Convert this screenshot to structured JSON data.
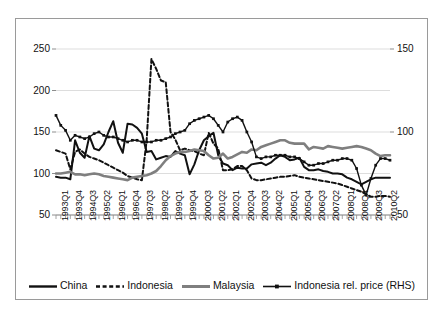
{
  "chart_data": {
    "type": "line",
    "title": "",
    "xlabel": "",
    "ylabel": "",
    "ylim": [
      50,
      250
    ],
    "y2lim": [
      50,
      150
    ],
    "grid": true,
    "legend_position": "bottom",
    "yticks": [
      50,
      100,
      150,
      200,
      250
    ],
    "y2ticks": [
      50,
      100,
      150
    ],
    "x": [
      "1993Q1",
      "1993Q2",
      "1993Q3",
      "1993Q4",
      "1994Q1",
      "1994Q2",
      "1994Q3",
      "1994Q4",
      "1995Q1",
      "1995Q2",
      "1995Q3",
      "1995Q4",
      "1996Q1",
      "1996Q2",
      "1996Q3",
      "1996Q4",
      "1997Q1",
      "1997Q2",
      "1997Q3",
      "1997Q4",
      "1998Q1",
      "1998Q2",
      "1998Q3",
      "1998Q4",
      "1999Q1",
      "1999Q2",
      "1999Q3",
      "1999Q4",
      "2000Q1",
      "2000Q2",
      "2000Q3",
      "2000Q4",
      "2001Q1",
      "2001Q2",
      "2001Q3",
      "2001Q4",
      "2002Q1",
      "2002Q2",
      "2002Q3",
      "2002Q4",
      "2003Q1",
      "2003Q2",
      "2003Q3",
      "2003Q4",
      "2004Q1",
      "2004Q2",
      "2004Q3",
      "2004Q4",
      "2005Q1",
      "2005Q2",
      "2005Q3",
      "2005Q4",
      "2006Q1",
      "2006Q2",
      "2006Q3",
      "2006Q4",
      "2007Q1",
      "2007Q2",
      "2007Q3",
      "2007Q4",
      "2008Q1",
      "2008Q2",
      "2008Q3",
      "2008Q4",
      "2009Q1",
      "2009Q2",
      "2009Q3",
      "2009Q4",
      "2010Q1",
      "2010Q2",
      "2010Q3"
    ],
    "xtick_labels": [
      "1993Q1",
      "1993Q4",
      "1994Q3",
      "1995Q2",
      "1996Q1",
      "1996Q4",
      "1997Q3",
      "1998Q2",
      "1999Q1",
      "1999Q4",
      "2000Q3",
      "2001Q2",
      "2002Q1",
      "2002Q4",
      "2003Q3",
      "2004Q2",
      "2005Q1",
      "2005Q4",
      "2006Q3",
      "2007Q2",
      "2008Q1",
      "2008Q4",
      "2009Q3",
      "2010Q2"
    ],
    "xtick_every": 3,
    "series": [
      {
        "name": "China",
        "axis": "left",
        "style": "solid",
        "color": "#111111",
        "width": 2.0,
        "markers": false,
        "values": [
          96,
          95,
          95,
          93,
          140,
          125,
          119,
          145,
          130,
          128,
          135,
          150,
          163,
          137,
          125,
          160,
          159,
          155,
          148,
          126,
          127,
          117,
          119,
          121,
          120,
          127,
          124,
          122,
          99,
          111,
          128,
          140,
          145,
          149,
          122,
          112,
          110,
          104,
          107,
          106,
          106,
          111,
          112,
          113,
          110,
          113,
          118,
          122,
          120,
          116,
          117,
          119,
          108,
          104,
          104,
          105,
          103,
          102,
          100,
          100,
          99,
          95,
          93,
          90,
          87,
          90,
          93,
          95,
          95,
          95,
          95
        ]
      },
      {
        "name": "Indonesia",
        "axis": "left",
        "style": "dashed",
        "color": "#111111",
        "width": 2.0,
        "markers": false,
        "values": [
          128,
          126,
          124,
          105,
          126,
          129,
          124,
          120,
          118,
          116,
          113,
          110,
          107,
          104,
          101,
          97,
          95,
          93,
          92,
          140,
          238,
          226,
          212,
          210,
          150,
          141,
          128,
          130,
          128,
          127,
          124,
          122,
          149,
          136,
          130,
          104,
          104,
          105,
          109,
          109,
          104,
          94,
          92,
          92,
          93,
          94,
          95,
          96,
          96,
          97,
          98,
          96,
          95,
          94,
          93,
          92,
          91,
          90,
          89,
          88,
          86,
          84,
          82,
          80,
          78,
          75,
          72,
          72,
          73,
          73,
          72
        ]
      },
      {
        "name": "Malaysia",
        "axis": "left",
        "style": "solid",
        "color": "#7f7f7f",
        "width": 2.6,
        "markers": false,
        "values": [
          100,
          100,
          101,
          102,
          99,
          99,
          98,
          99,
          100,
          99,
          97,
          96,
          95,
          94,
          93,
          92,
          95,
          96,
          97,
          98,
          100,
          103,
          109,
          116,
          121,
          124,
          126,
          126,
          127,
          129,
          128,
          127,
          122,
          118,
          119,
          124,
          118,
          120,
          123,
          126,
          125,
          129,
          128,
          132,
          134,
          136,
          138,
          140,
          140,
          137,
          136,
          136,
          136,
          129,
          132,
          131,
          130,
          133,
          132,
          131,
          130,
          131,
          132,
          133,
          132,
          130,
          128,
          124,
          121,
          122,
          122
        ]
      },
      {
        "name": "Indonesia rel. price (RHS)",
        "axis": "right",
        "style": "solid-markers",
        "color": "#111111",
        "width": 1.4,
        "markers": true,
        "values": [
          110,
          104,
          101,
          95,
          98,
          97,
          96,
          97,
          99,
          100,
          98,
          97,
          97,
          96,
          95,
          94,
          95,
          95,
          94,
          94,
          94,
          95,
          95,
          96,
          97,
          99,
          100,
          101,
          105,
          107,
          108,
          109,
          110,
          108,
          104,
          100,
          106,
          108,
          109,
          107,
          100,
          94,
          85,
          84,
          85,
          85,
          86,
          86,
          86,
          85,
          85,
          84,
          82,
          80,
          80,
          81,
          81,
          82,
          83,
          83,
          84,
          84,
          83,
          78,
          68,
          62,
          72,
          80,
          84,
          84,
          83
        ]
      }
    ]
  },
  "legend": {
    "items": [
      {
        "label": "China",
        "key": "line-solid-black"
      },
      {
        "label": "Indonesia",
        "key": "line-dashed-black"
      },
      {
        "label": "Malaysia",
        "key": "line-solid-gray"
      },
      {
        "label": "Indonesia rel. price (RHS)",
        "key": "line-solid-black-markers"
      }
    ]
  }
}
